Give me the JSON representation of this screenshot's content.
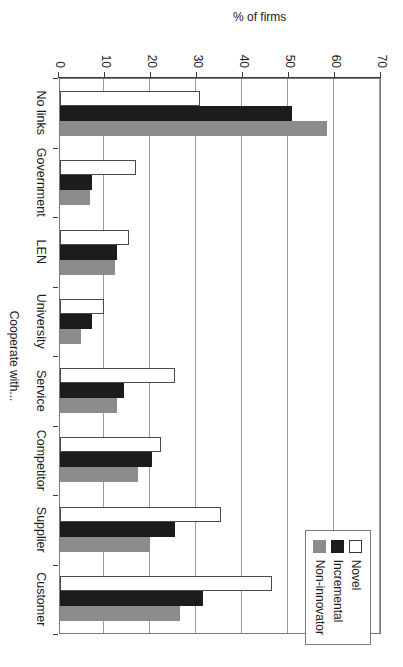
{
  "chart_data": {
    "type": "bar",
    "title": "",
    "subtitle": "",
    "xlabel": "Cooperate with...",
    "ylabel": "% of firms",
    "ylim": [
      0,
      70
    ],
    "ytick_step": 10,
    "yticks": [
      0,
      10,
      20,
      30,
      40,
      50,
      60,
      70
    ],
    "ytick_labels": [
      "0",
      "10",
      "20",
      "30",
      "40",
      "50",
      "60",
      "70"
    ],
    "grid": true,
    "grid_axis": "value",
    "orientation": "vertical-bars-rotated-90",
    "legend_position": "top-right",
    "categories": [
      "No links",
      "Government",
      "LEN",
      "University",
      "Service",
      "Competitor",
      "Supplier",
      "Customer"
    ],
    "series": [
      {
        "name": "Novel",
        "color": "#ffffff",
        "edge_color": "#4a4a4a",
        "values": [
          30.5,
          16.5,
          15.0,
          9.5,
          25.0,
          22.0,
          35.0,
          46.0
        ]
      },
      {
        "name": "Incremental",
        "color": "#1c1c1c",
        "edge_color": "#1c1c1c",
        "values": [
          50.5,
          7.0,
          12.5,
          7.0,
          14.0,
          20.0,
          25.0,
          31.0
        ]
      },
      {
        "name": "Non-innovator",
        "color": "#8c8c8c",
        "edge_color": "#8c8c8c",
        "values": [
          58.0,
          6.5,
          12.0,
          4.5,
          12.5,
          17.0,
          19.5,
          26.0
        ]
      }
    ]
  },
  "legend": {
    "items": [
      {
        "label": "Novel",
        "swatch": "novel"
      },
      {
        "label": "Incremental",
        "swatch": "incremental"
      },
      {
        "label": "Non-innovator",
        "swatch": "noninnovator"
      }
    ]
  },
  "axes": {
    "value_axis_title": "% of firms",
    "category_axis_title": "Cooperate with..."
  }
}
